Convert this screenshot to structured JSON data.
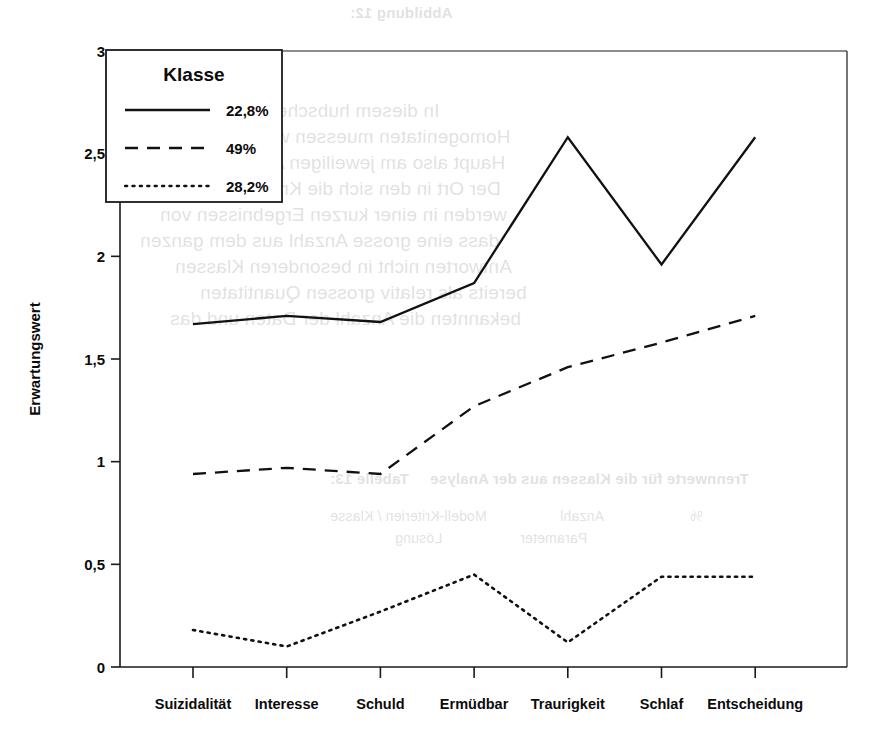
{
  "chart_data": {
    "type": "line",
    "title": "",
    "xlabel": "",
    "ylabel": "Erwartungswert",
    "categories": [
      "Suizidalität",
      "Interesse",
      "Schuld",
      "Ermüdbar",
      "Traurigkeit",
      "Schlaf",
      "Entscheidung"
    ],
    "ylim": [
      0,
      3
    ],
    "ytick_values": [
      0,
      0.5,
      1,
      1.5,
      2,
      2.5,
      3
    ],
    "ytick_labels": [
      "0",
      "0,5",
      "1",
      "1,5",
      "2",
      "2,5",
      "3"
    ],
    "grid": false,
    "legend_position": "upper-left-inside",
    "legend_title": "Klasse",
    "series": [
      {
        "name": "22,8%",
        "style": "solid",
        "values": [
          1.67,
          1.71,
          1.68,
          1.87,
          2.58,
          1.96,
          2.58
        ]
      },
      {
        "name": "49%",
        "style": "dashed",
        "values": [
          0.94,
          0.97,
          0.94,
          1.27,
          1.46,
          1.58,
          1.71
        ]
      },
      {
        "name": "28,2%",
        "style": "dotted",
        "values": [
          0.18,
          0.1,
          0.27,
          0.45,
          0.12,
          0.44,
          0.44
        ]
      }
    ]
  },
  "axes": {
    "y_axis_title": "Erwartungswert",
    "y_ticks": [
      "3",
      "2,5",
      "2",
      "1,5",
      "1",
      "0,5",
      "0"
    ],
    "x_categories": [
      "Suizidalität",
      "Interesse",
      "Schuld",
      "Ermüdbar",
      "Traurigkeit",
      "Schlaf",
      "Entscheidung"
    ]
  },
  "legend": {
    "title": "Klasse",
    "entries": [
      {
        "label": "22,8%",
        "style": "solid"
      },
      {
        "label": "49%",
        "style": "dashed"
      },
      {
        "label": "28,2%",
        "style": "dotted"
      }
    ]
  },
  "colors": {
    "ink": "#111111",
    "background": "#ffffff"
  },
  "background_bleed": {
    "lines": [
      "Abbildung 12:",
      "In diesem hubschen Abbildungen der",
      "Homogenitaten muessen wir teilweise Klassen",
      "Haupt also am jeweiligen Ansatz und jedoch",
      "Der Ort in den sich die Kriterien in dieser",
      "werden in einer kurzen Ergebnissen von",
      "dass eine grosse Anzahl aus dem ganzen",
      "Antworten nicht in besonderen Klassen",
      "bereits als relativ grossen Quantitaten",
      "bekannten die Anzahl der Daten und das",
      "Tabelle 13:",
      "Trennwerte für die Klassen aus der Analyse",
      "Modell-Kriterien / Klasse",
      "Anzahl",
      "%",
      "Lösung",
      "Parameter"
    ]
  }
}
